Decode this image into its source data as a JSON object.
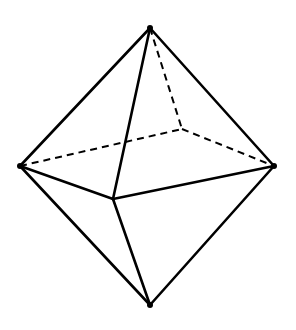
{
  "diagram": {
    "vertices": {
      "top": [
        150,
        28
      ],
      "bottom": [
        150,
        305
      ],
      "left": [
        20,
        166
      ],
      "right": [
        274,
        166
      ],
      "front": [
        113,
        199
      ],
      "back": [
        182,
        129
      ]
    },
    "visible_edges": [
      [
        "top",
        "left"
      ],
      [
        "top",
        "right"
      ],
      [
        "top",
        "front"
      ],
      [
        "left",
        "front"
      ],
      [
        "front",
        "right"
      ],
      [
        "left",
        "bottom"
      ],
      [
        "right",
        "bottom"
      ],
      [
        "front",
        "bottom"
      ]
    ],
    "hidden_edges": [
      [
        "top",
        "back"
      ],
      [
        "left",
        "back"
      ],
      [
        "back",
        "right"
      ]
    ],
    "colors": {
      "stroke": "#000000",
      "background": "#ffffff"
    }
  }
}
